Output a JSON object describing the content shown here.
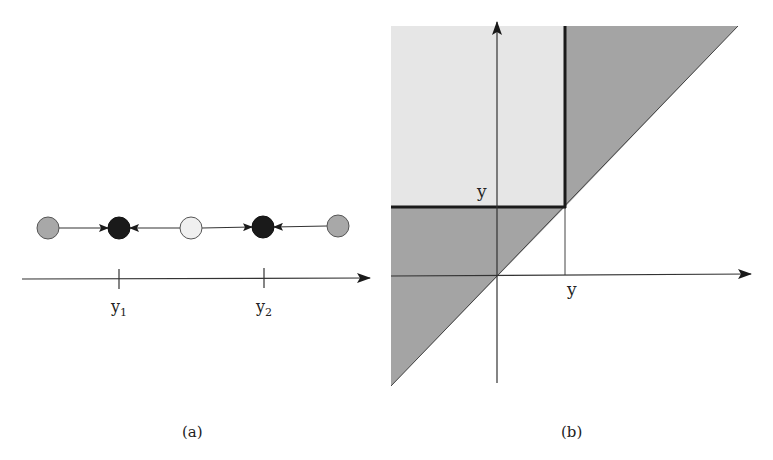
{
  "panel_a": {
    "caption": "(a)",
    "axis": {
      "x1": 22,
      "x2": 370,
      "y": 279
    },
    "ticks": [
      {
        "x": 119,
        "label": "y",
        "sub": "1"
      },
      {
        "x": 264,
        "label": "y",
        "sub": "2"
      }
    ],
    "nodes": [
      {
        "x": 48,
        "y": 228,
        "fill": "#a8a8a8",
        "kind": "unstable-gray"
      },
      {
        "x": 119,
        "y": 228,
        "fill": "#1a1a1a",
        "kind": "stable-black"
      },
      {
        "x": 191,
        "y": 228,
        "fill": "#f0f0f0",
        "kind": "unstable-white"
      },
      {
        "x": 263,
        "y": 227,
        "fill": "#1a1a1a",
        "kind": "stable-black"
      },
      {
        "x": 338,
        "y": 226,
        "fill": "#a8a8a8",
        "kind": "unstable-gray"
      }
    ],
    "arrows": [
      {
        "from": 0,
        "to": 1
      },
      {
        "from": 2,
        "to": 1
      },
      {
        "from": 2,
        "to": 3
      },
      {
        "from": 4,
        "to": 3
      }
    ]
  },
  "panel_b": {
    "caption": "(b)",
    "y_axis_label": "y",
    "x_axis_label": "y",
    "colors": {
      "light_region": "#e6e6e6",
      "dark_region": "#a4a4a4",
      "thick_line": "#1a1a1a"
    }
  }
}
